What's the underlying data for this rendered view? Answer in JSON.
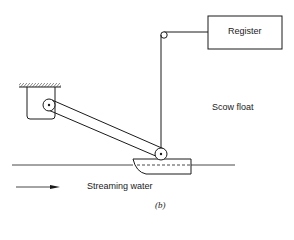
{
  "diagram": {
    "labels": {
      "register": "Register",
      "scow_float": "Scow float",
      "streaming_water": "Streaming water",
      "caption": "(b)"
    },
    "colors": {
      "stroke": "#1a1a1a",
      "background": "#ffffff"
    }
  }
}
